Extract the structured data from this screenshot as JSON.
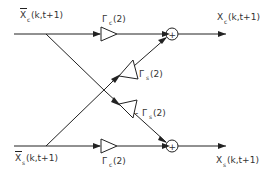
{
  "diagram": {
    "type": "signal-flow graph (butterfly)",
    "inputs": {
      "top": {
        "base": "X",
        "sub": "c",
        "arg": "(k,t+1)",
        "accent": "bar"
      },
      "bottom": {
        "base": "X",
        "sub": "s",
        "arg": "(k,t+1)",
        "accent": "bar"
      }
    },
    "outputs": {
      "top": {
        "base": "X",
        "sub": "c",
        "arg": "(k,t+1)"
      },
      "bottom": {
        "base": "X",
        "sub": "s",
        "arg": "(k,t+1)"
      }
    },
    "gains": {
      "top_straight": {
        "base": "Γ",
        "sub": "c",
        "arg": "(2)"
      },
      "cross_up": {
        "base": "Γ",
        "sub": "s",
        "arg": "(2)"
      },
      "cross_down": {
        "prefix": "- ",
        "base": "Γ",
        "sub": "s",
        "arg": "(2)"
      },
      "bottom_straight": {
        "base": "Γ",
        "sub": "c",
        "arg": "(2)"
      }
    },
    "summing_nodes": {
      "top": {
        "symbol": "+"
      },
      "bottom": {
        "symbol": "+"
      }
    },
    "colors": {
      "stroke": "#222222",
      "text": "#333333",
      "background": "#ffffff"
    }
  }
}
